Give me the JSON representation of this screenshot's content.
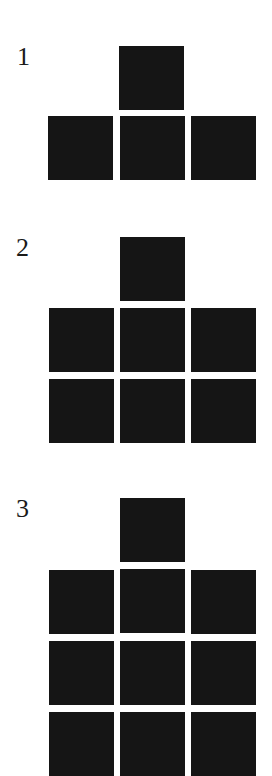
{
  "figures": [
    {
      "label": "1",
      "top_square": true,
      "grid_rows": 1,
      "grid_cols": 3
    },
    {
      "label": "2",
      "top_square": true,
      "grid_rows": 2,
      "grid_cols": 3
    },
    {
      "label": "3",
      "top_square": true,
      "grid_rows": 3,
      "grid_cols": 3
    }
  ],
  "colors": {
    "square": "#151515",
    "background": "#ffffff",
    "label": "#1a1a1a"
  }
}
